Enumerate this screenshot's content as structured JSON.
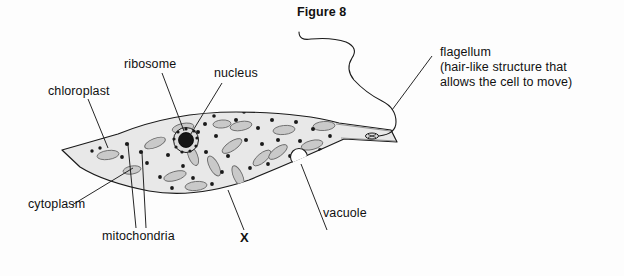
{
  "figure": {
    "title": "Figure 8"
  },
  "labels": {
    "chloroplast": "chloroplast",
    "ribosome": "ribosome",
    "nucleus": "nucleus",
    "cytoplasm": "cytoplasm",
    "mitochondria": "mitochondria",
    "vacuole": "vacuole",
    "marker_x": "X",
    "flagellum_name": "flagellum",
    "flagellum_desc_line1": "(hair-like structure that",
    "flagellum_desc_line2": "allows the cell to move)"
  },
  "colors": {
    "ink": "#1a1a1a",
    "cytoplasm_fill": "#e8e8e8",
    "organelle_fill": "#c9c9c9",
    "organelle_stroke": "#6b6b6b",
    "dot_fill": "#1a1a1a",
    "vacuole_fill": "#ffffff",
    "nucleus_fill": "#1a1a1a",
    "page_bg": "#fdfdfd"
  },
  "structures": {
    "cell_outline": "spindle / lens shaped cell body with pointed left tip and tapered right neck",
    "nucleus": "dark filled circle ringed by small granules",
    "chloroplasts": "gray ellipses scattered through cytoplasm at varied angles",
    "ribosomes": "small black dots scattered through cytoplasm",
    "mitochondria": "small black dots near the left region of the cell",
    "vacuole": "unfilled white circle in the right half of the cell",
    "flagellum": "long wavy filament emerging from the right tip of the cell"
  }
}
